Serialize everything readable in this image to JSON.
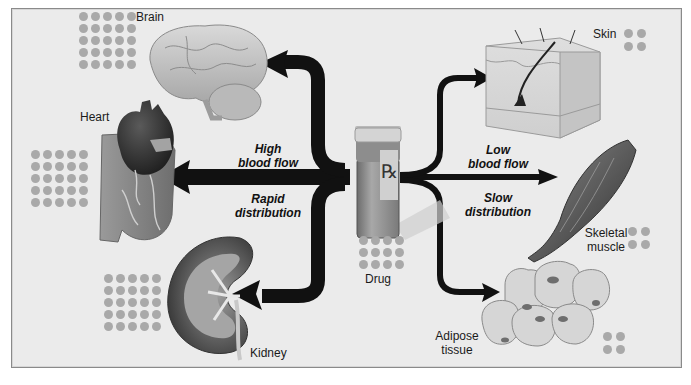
{
  "diagram": {
    "center": {
      "label": "Drug",
      "bottle_mark": "℞",
      "icon": "pill-bottle-icon"
    },
    "left_group": {
      "flow_label_line1": "High",
      "flow_label_line2": "blood flow",
      "rate_label_line1": "Rapid",
      "rate_label_line2": "distribution",
      "targets": [
        {
          "label": "Brain",
          "icon": "brain-icon",
          "dot_grid": "5x5"
        },
        {
          "label": "Heart",
          "icon": "heart-icon",
          "dot_grid": "5x5"
        },
        {
          "label": "Kidney",
          "icon": "kidney-icon",
          "dot_grid": "5x5"
        }
      ]
    },
    "right_group": {
      "flow_label_line1": "Low",
      "flow_label_line2": "blood flow",
      "rate_label_line1": "Slow",
      "rate_label_line2": "distribution",
      "targets": [
        {
          "label": "Skin",
          "icon": "skin-icon",
          "dot_grid": "2x2"
        },
        {
          "label_line1": "Skeletal",
          "label_line2": "muscle",
          "icon": "muscle-icon",
          "dot_grid": "2x2"
        },
        {
          "label_line1": "Adipose",
          "label_line2": "tissue",
          "icon": "adipose-cells-icon",
          "dot_grid": "2x2"
        }
      ]
    },
    "drug_dot_grid": "4x3",
    "colors": {
      "background": "#ebebeb",
      "frame_border": "#8a8a8a",
      "arrow": "#111111",
      "dot": "#a9a9a9",
      "text": "#1a1a1a"
    }
  }
}
